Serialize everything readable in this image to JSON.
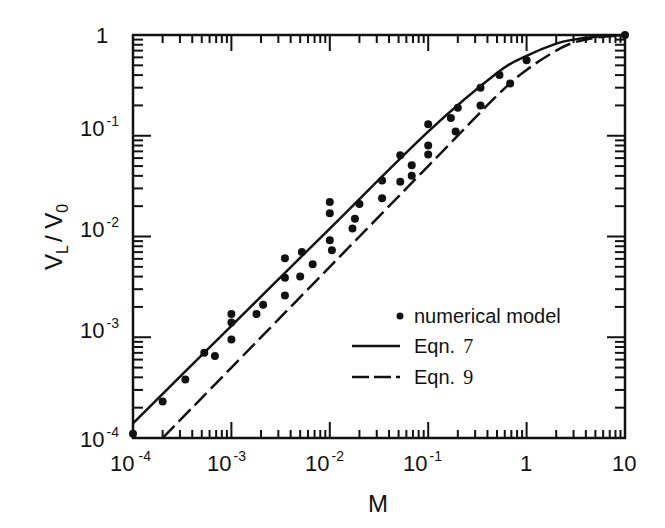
{
  "chart_data": {
    "type": "line",
    "title": "",
    "xlabel": "M",
    "ylabel": "V_L / V_0",
    "xscale": "log",
    "yscale": "log",
    "xlim": [
      0.0001,
      10
    ],
    "ylim": [
      0.0001,
      1
    ],
    "grid": false,
    "x_tick_labels": [
      "10^-4",
      "10^-3",
      "10^-2",
      "10^-1",
      "1",
      "10"
    ],
    "y_tick_labels": [
      "10^-4",
      "10^-3",
      "10^-2",
      "10^-1",
      "1"
    ],
    "legend_position": "lower right (inside)",
    "legend": [
      {
        "marker": "dot",
        "label": "numerical model"
      },
      {
        "marker": "solid-line",
        "label": "Eqn. 7"
      },
      {
        "marker": "dashed-line",
        "label": "Eqn. 9"
      }
    ],
    "series": [
      {
        "name": "numerical model",
        "style": "scatter",
        "points": [
          [
            0.0001,
            0.00011
          ],
          [
            0.0002,
            0.00023
          ],
          [
            0.00034,
            0.00038
          ],
          [
            0.00053,
            0.0007
          ],
          [
            0.00068,
            0.00065
          ],
          [
            0.001,
            0.00095
          ],
          [
            0.001,
            0.0014
          ],
          [
            0.001,
            0.0017
          ],
          [
            0.0018,
            0.0017
          ],
          [
            0.0021,
            0.0021
          ],
          [
            0.0035,
            0.0026
          ],
          [
            0.0035,
            0.0039
          ],
          [
            0.0035,
            0.0061
          ],
          [
            0.005,
            0.004
          ],
          [
            0.0052,
            0.007
          ],
          [
            0.0067,
            0.0053
          ],
          [
            0.0105,
            0.0073
          ],
          [
            0.01,
            0.0092
          ],
          [
            0.01,
            0.017
          ],
          [
            0.01,
            0.022
          ],
          [
            0.017,
            0.012
          ],
          [
            0.018,
            0.015
          ],
          [
            0.02,
            0.021
          ],
          [
            0.034,
            0.024
          ],
          [
            0.034,
            0.036
          ],
          [
            0.052,
            0.035
          ],
          [
            0.052,
            0.064
          ],
          [
            0.068,
            0.04
          ],
          [
            0.068,
            0.051
          ],
          [
            0.1,
            0.065
          ],
          [
            0.1,
            0.08
          ],
          [
            0.1,
            0.13
          ],
          [
            0.17,
            0.15
          ],
          [
            0.19,
            0.11
          ],
          [
            0.2,
            0.19
          ],
          [
            0.34,
            0.2
          ],
          [
            0.34,
            0.3
          ],
          [
            0.53,
            0.4
          ],
          [
            0.68,
            0.33
          ],
          [
            1.0,
            0.56
          ],
          [
            10,
            1.0
          ]
        ]
      },
      {
        "name": "Eqn. 7",
        "style": "solid",
        "x": [
          0.0001,
          0.001,
          0.01,
          0.1,
          0.5,
          1,
          2,
          3,
          5,
          10
        ],
        "y": [
          0.00014,
          0.0013,
          0.012,
          0.11,
          0.42,
          0.62,
          0.82,
          0.9,
          0.96,
          1.0
        ]
      },
      {
        "name": "Eqn. 9",
        "style": "dashed",
        "x": [
          0.0002,
          0.001,
          0.01,
          0.1,
          0.5,
          1,
          2,
          3,
          5,
          10
        ],
        "y": [
          0.0001,
          0.0005,
          0.005,
          0.05,
          0.25,
          0.45,
          0.7,
          0.84,
          0.94,
          1.0
        ]
      }
    ]
  },
  "axes": {
    "x_title": "M",
    "y_title_main": "V",
    "y_title_sub1": "L",
    "y_title_sep": "/ V",
    "y_title_sub2": "0",
    "x_ticks": [
      {
        "base": "10",
        "exp": "-4"
      },
      {
        "base": "10",
        "exp": "-3"
      },
      {
        "base": "10",
        "exp": "-2"
      },
      {
        "base": "10",
        "exp": "-1"
      },
      {
        "base": "1",
        "exp": ""
      },
      {
        "base": "10",
        "exp": ""
      }
    ],
    "y_ticks": [
      {
        "base": "1",
        "exp": ""
      },
      {
        "base": "10",
        "exp": "-1"
      },
      {
        "base": "10",
        "exp": "-2"
      },
      {
        "base": "10",
        "exp": "-3"
      },
      {
        "base": "10",
        "exp": "-4"
      }
    ]
  },
  "legend": {
    "item1": "numerical model",
    "item2_text": "Eqn.",
    "item2_num": "7",
    "item3_text": "Eqn.",
    "item3_num": "9"
  },
  "colors": {
    "ink": "#111111",
    "background": "#ffffff"
  }
}
